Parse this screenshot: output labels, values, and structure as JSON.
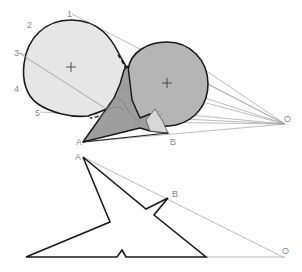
{
  "diagram": {
    "colors": {
      "background": "#ffffff",
      "sphere_left_fill": "#e6e6e6",
      "sphere_right_fill": "#b5b5b5",
      "shadow_fill": "#9e9e9e",
      "outline": "#1a1a1a",
      "construction_line": "#9a9a9a",
      "label": "#888888"
    },
    "upper_figure": {
      "edge_labels": [
        "1",
        "2",
        "3",
        "4",
        "5"
      ],
      "point_labels": {
        "A": "A",
        "B": "B",
        "O": "O",
        "E": "E",
        "F": "F",
        "G": "G",
        "H": "H"
      }
    },
    "lower_figure": {
      "point_labels": {
        "A": "A",
        "B": "B",
        "O": "O"
      }
    }
  }
}
